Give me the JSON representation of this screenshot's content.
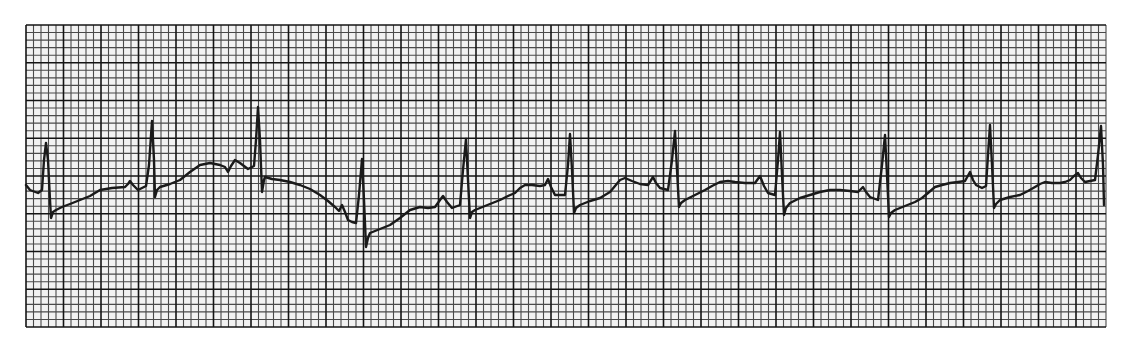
{
  "chart_data": {
    "type": "line",
    "title": "",
    "subtitle": "",
    "xlabel": "",
    "ylabel": "",
    "grid": {
      "on": true,
      "x0": 26,
      "y0": 25,
      "small_box_px": 7.5,
      "small_box_py": 7.55,
      "cols_small": 144,
      "rows_small": 40,
      "major_every": 5
    },
    "legend": null,
    "colors": {
      "paper": "#f2f2f2",
      "minor_line": "#4a4a4a",
      "major_line": "#141414",
      "trace": "#1a1a1a",
      "background": "#ffffff"
    },
    "r_peaks_x": [
      46,
      152,
      258,
      362,
      466,
      570,
      675,
      780,
      885,
      990,
      1101
    ],
    "trace_points": [
      [
        26,
        185
      ],
      [
        30,
        190
      ],
      [
        38,
        193
      ],
      [
        42,
        190
      ],
      [
        44,
        160
      ],
      [
        46,
        143
      ],
      [
        48,
        160
      ],
      [
        50,
        200
      ],
      [
        51,
        218
      ],
      [
        53,
        212
      ],
      [
        56,
        210
      ],
      [
        62,
        207
      ],
      [
        70,
        204
      ],
      [
        80,
        200
      ],
      [
        90,
        196
      ],
      [
        100,
        190
      ],
      [
        112,
        188
      ],
      [
        125,
        187
      ],
      [
        128,
        184
      ],
      [
        130,
        181
      ],
      [
        133,
        185
      ],
      [
        138,
        190
      ],
      [
        142,
        188
      ],
      [
        146,
        186
      ],
      [
        149,
        165
      ],
      [
        152,
        121
      ],
      [
        154,
        160
      ],
      [
        155,
        197
      ],
      [
        157,
        190
      ],
      [
        160,
        187
      ],
      [
        170,
        184
      ],
      [
        180,
        180
      ],
      [
        190,
        172
      ],
      [
        200,
        165
      ],
      [
        210,
        163
      ],
      [
        220,
        165
      ],
      [
        225,
        167
      ],
      [
        228,
        172
      ],
      [
        231,
        166
      ],
      [
        235,
        160
      ],
      [
        240,
        163
      ],
      [
        248,
        169
      ],
      [
        254,
        166
      ],
      [
        256,
        140
      ],
      [
        258,
        107
      ],
      [
        260,
        140
      ],
      [
        262,
        192
      ],
      [
        264,
        180
      ],
      [
        265,
        177
      ],
      [
        272,
        179
      ],
      [
        280,
        180
      ],
      [
        290,
        182
      ],
      [
        300,
        185
      ],
      [
        310,
        189
      ],
      [
        320,
        195
      ],
      [
        328,
        201
      ],
      [
        335,
        207
      ],
      [
        339,
        211
      ],
      [
        342,
        205
      ],
      [
        345,
        212
      ],
      [
        348,
        220
      ],
      [
        352,
        222
      ],
      [
        356,
        223
      ],
      [
        359,
        195
      ],
      [
        362,
        159
      ],
      [
        364,
        200
      ],
      [
        366,
        247
      ],
      [
        368,
        238
      ],
      [
        370,
        233
      ],
      [
        380,
        229
      ],
      [
        390,
        225
      ],
      [
        400,
        218
      ],
      [
        410,
        210
      ],
      [
        420,
        207
      ],
      [
        428,
        208
      ],
      [
        435,
        207
      ],
      [
        440,
        200
      ],
      [
        443,
        196
      ],
      [
        447,
        202
      ],
      [
        452,
        208
      ],
      [
        460,
        205
      ],
      [
        463,
        170
      ],
      [
        466,
        139
      ],
      [
        468,
        180
      ],
      [
        470,
        218
      ],
      [
        472,
        212
      ],
      [
        475,
        210
      ],
      [
        485,
        206
      ],
      [
        500,
        200
      ],
      [
        508,
        196
      ],
      [
        515,
        193
      ],
      [
        520,
        188
      ],
      [
        525,
        185
      ],
      [
        532,
        185
      ],
      [
        540,
        186
      ],
      [
        545,
        185
      ],
      [
        548,
        179
      ],
      [
        551,
        187
      ],
      [
        555,
        195
      ],
      [
        560,
        195
      ],
      [
        565,
        195
      ],
      [
        568,
        165
      ],
      [
        570,
        134
      ],
      [
        572,
        170
      ],
      [
        574,
        213
      ],
      [
        576,
        208
      ],
      [
        580,
        205
      ],
      [
        590,
        201
      ],
      [
        600,
        198
      ],
      [
        610,
        192
      ],
      [
        615,
        186
      ],
      [
        620,
        180
      ],
      [
        625,
        178
      ],
      [
        632,
        181
      ],
      [
        640,
        184
      ],
      [
        648,
        185
      ],
      [
        653,
        177
      ],
      [
        656,
        183
      ],
      [
        660,
        188
      ],
      [
        668,
        190
      ],
      [
        672,
        160
      ],
      [
        675,
        131
      ],
      [
        677,
        170
      ],
      [
        679,
        207
      ],
      [
        681,
        203
      ],
      [
        685,
        200
      ],
      [
        695,
        195
      ],
      [
        705,
        190
      ],
      [
        712,
        186
      ],
      [
        720,
        182
      ],
      [
        728,
        181
      ],
      [
        735,
        182
      ],
      [
        745,
        183
      ],
      [
        755,
        183
      ],
      [
        760,
        176
      ],
      [
        764,
        186
      ],
      [
        768,
        193
      ],
      [
        775,
        195
      ],
      [
        778,
        160
      ],
      [
        780,
        132
      ],
      [
        782,
        175
      ],
      [
        784,
        215
      ],
      [
        786,
        208
      ],
      [
        790,
        203
      ],
      [
        800,
        198
      ],
      [
        810,
        195
      ],
      [
        820,
        192
      ],
      [
        830,
        190
      ],
      [
        840,
        190
      ],
      [
        850,
        191
      ],
      [
        858,
        192
      ],
      [
        863,
        187
      ],
      [
        866,
        192
      ],
      [
        870,
        197
      ],
      [
        878,
        200
      ],
      [
        882,
        165
      ],
      [
        885,
        135
      ],
      [
        887,
        175
      ],
      [
        889,
        217
      ],
      [
        891,
        213
      ],
      [
        895,
        210
      ],
      [
        905,
        206
      ],
      [
        915,
        202
      ],
      [
        922,
        198
      ],
      [
        928,
        193
      ],
      [
        935,
        187
      ],
      [
        942,
        185
      ],
      [
        950,
        183
      ],
      [
        958,
        182
      ],
      [
        965,
        181
      ],
      [
        970,
        172
      ],
      [
        973,
        180
      ],
      [
        976,
        185
      ],
      [
        982,
        188
      ],
      [
        986,
        186
      ],
      [
        988,
        155
      ],
      [
        990,
        125
      ],
      [
        992,
        165
      ],
      [
        994,
        208
      ],
      [
        996,
        204
      ],
      [
        1000,
        200
      ],
      [
        1010,
        197
      ],
      [
        1020,
        195
      ],
      [
        1028,
        191
      ],
      [
        1035,
        187
      ],
      [
        1040,
        184
      ],
      [
        1045,
        182
      ],
      [
        1052,
        183
      ],
      [
        1060,
        183
      ],
      [
        1065,
        182
      ],
      [
        1070,
        180
      ],
      [
        1074,
        176
      ],
      [
        1078,
        173
      ],
      [
        1081,
        178
      ],
      [
        1085,
        182
      ],
      [
        1090,
        181
      ],
      [
        1095,
        180
      ],
      [
        1098,
        155
      ],
      [
        1101,
        126
      ],
      [
        1103,
        165
      ],
      [
        1104,
        205
      ]
    ]
  }
}
